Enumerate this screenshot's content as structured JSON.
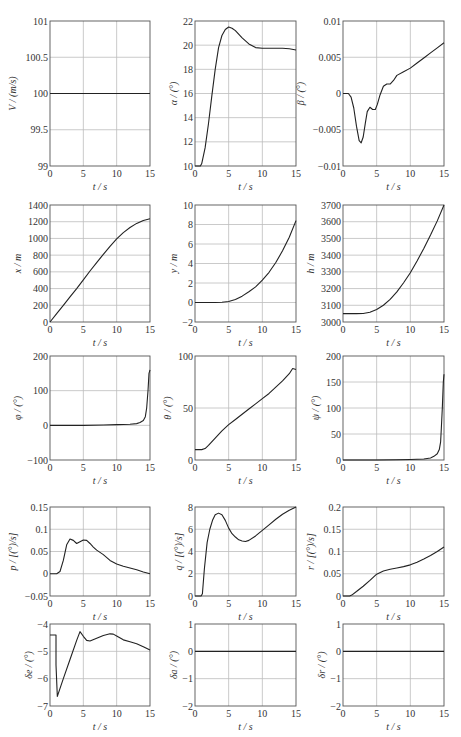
{
  "chart_data": [
    {
      "type": "line",
      "id": "V",
      "title": "",
      "xlabel": "t / s",
      "ylabel": "V / (m/s)",
      "xlim": [
        0,
        15
      ],
      "ylim": [
        99,
        101
      ],
      "xticks": [
        0,
        5,
        10,
        15
      ],
      "yticks": [
        99,
        99.5,
        100,
        100.5,
        101
      ],
      "yticklabels": [
        "99",
        "99.5",
        "100",
        "100.5",
        "101"
      ],
      "grid": true,
      "series": [
        {
          "name": "V",
          "x": [
            0,
            15
          ],
          "y": [
            100,
            100
          ]
        }
      ]
    },
    {
      "type": "line",
      "id": "alpha",
      "title": "",
      "xlabel": "t / s",
      "ylabel": "α / (°)",
      "xlim": [
        0,
        15
      ],
      "ylim": [
        10,
        22
      ],
      "xticks": [
        0,
        5,
        10,
        15
      ],
      "yticks": [
        10,
        12,
        14,
        16,
        18,
        20,
        22
      ],
      "yticklabels": [
        "10",
        "12",
        "14",
        "16",
        "18",
        "20",
        "22"
      ],
      "grid": true,
      "series": [
        {
          "name": "alpha",
          "x": [
            0,
            0.8,
            1.0,
            1.5,
            2,
            2.5,
            3,
            3.5,
            4,
            4.5,
            5,
            5.5,
            6,
            7,
            8,
            9,
            10,
            11,
            12,
            13,
            14,
            15
          ],
          "y": [
            10,
            10,
            10.2,
            11.5,
            13.5,
            15.8,
            18,
            19.8,
            20.8,
            21.3,
            21.5,
            21.4,
            21.2,
            20.6,
            20.1,
            19.8,
            19.75,
            19.75,
            19.75,
            19.75,
            19.7,
            19.6
          ]
        }
      ]
    },
    {
      "type": "line",
      "id": "beta",
      "title": "",
      "xlabel": "t / s",
      "ylabel": "β / (°)",
      "xlim": [
        0,
        15
      ],
      "ylim": [
        -0.01,
        0.01
      ],
      "xticks": [
        0,
        5,
        10,
        15
      ],
      "yticks": [
        -0.01,
        -0.005,
        0,
        0.005,
        0.01
      ],
      "yticklabels": [
        "−0.01",
        "−0.005",
        "0",
        "0.005",
        "0.01"
      ],
      "grid": true,
      "series": [
        {
          "name": "beta",
          "x": [
            0,
            0.8,
            1.2,
            1.6,
            2.0,
            2.4,
            2.7,
            3.0,
            3.3,
            3.6,
            4.0,
            4.4,
            4.8,
            5.1,
            5.5,
            6.0,
            6.5,
            7.0,
            7.5,
            8,
            9,
            10,
            11,
            12,
            13,
            14,
            15
          ],
          "y": [
            0,
            0,
            -0.0005,
            -0.002,
            -0.0045,
            -0.0065,
            -0.0068,
            -0.006,
            -0.0042,
            -0.0025,
            -0.0019,
            -0.0022,
            -0.0022,
            -0.0015,
            -0.0002,
            0.001,
            0.0013,
            0.0013,
            0.0018,
            0.0025,
            0.003,
            0.0035,
            0.0042,
            0.0049,
            0.0056,
            0.0063,
            0.007
          ]
        }
      ]
    },
    {
      "type": "line",
      "id": "x",
      "title": "",
      "xlabel": "t / s",
      "ylabel": "x / m",
      "xlim": [
        0,
        15
      ],
      "ylim": [
        0,
        1400
      ],
      "xticks": [
        0,
        5,
        10,
        15
      ],
      "yticks": [
        0,
        200,
        400,
        600,
        800,
        1000,
        1200,
        1400
      ],
      "yticklabels": [
        "0",
        "200",
        "400",
        "600",
        "800",
        "1000",
        "1200",
        "1400"
      ],
      "grid": true,
      "series": [
        {
          "name": "x",
          "x": [
            0,
            1,
            2,
            3,
            4,
            5,
            6,
            7,
            8,
            9,
            10,
            11,
            12,
            13,
            14,
            15
          ],
          "y": [
            0,
            100,
            200,
            300,
            400,
            505,
            610,
            710,
            810,
            905,
            995,
            1070,
            1130,
            1180,
            1215,
            1235
          ]
        }
      ]
    },
    {
      "type": "line",
      "id": "y",
      "title": "",
      "xlabel": "t / s",
      "ylabel": "y / m",
      "xlim": [
        0,
        15
      ],
      "ylim": [
        -2,
        10
      ],
      "xticks": [
        0,
        5,
        10,
        15
      ],
      "yticks": [
        -2,
        0,
        2,
        4,
        6,
        8,
        10
      ],
      "yticklabels": [
        "−2",
        "0",
        "2",
        "4",
        "6",
        "8",
        "10"
      ],
      "grid": true,
      "series": [
        {
          "name": "y",
          "x": [
            0,
            3,
            4,
            5,
            6,
            7,
            8,
            9,
            10,
            11,
            12,
            13,
            14,
            15
          ],
          "y": [
            0,
            0,
            0.02,
            0.1,
            0.3,
            0.65,
            1.1,
            1.6,
            2.3,
            3.1,
            4.1,
            5.3,
            6.7,
            8.4
          ]
        }
      ]
    },
    {
      "type": "line",
      "id": "h",
      "title": "",
      "xlabel": "t / s",
      "ylabel": "h / m",
      "xlim": [
        0,
        15
      ],
      "ylim": [
        3000,
        3700
      ],
      "xticks": [
        0,
        5,
        10,
        15
      ],
      "yticks": [
        3000,
        3100,
        3200,
        3300,
        3400,
        3500,
        3600,
        3700
      ],
      "yticklabels": [
        "3000",
        "3100",
        "3200",
        "3300",
        "3400",
        "3500",
        "3600",
        "3700"
      ],
      "grid": true,
      "series": [
        {
          "name": "h",
          "x": [
            0,
            1,
            2,
            3,
            4,
            5,
            6,
            7,
            8,
            9,
            10,
            11,
            12,
            13,
            14,
            15
          ],
          "y": [
            3050,
            3050,
            3050,
            3051,
            3058,
            3075,
            3100,
            3135,
            3180,
            3235,
            3295,
            3365,
            3440,
            3520,
            3605,
            3700
          ]
        }
      ]
    },
    {
      "type": "line",
      "id": "phi",
      "title": "",
      "xlabel": "t / s",
      "ylabel": "φ / (°)",
      "xlim": [
        0,
        15
      ],
      "ylim": [
        -100,
        200
      ],
      "xticks": [
        0,
        5,
        10,
        15
      ],
      "yticks": [
        -100,
        0,
        100,
        200
      ],
      "yticklabels": [
        "−100",
        "0",
        "100",
        "200"
      ],
      "grid": true,
      "series": [
        {
          "name": "phi",
          "x": [
            0,
            5,
            8,
            10,
            12,
            13,
            13.5,
            14,
            14.3,
            14.5,
            14.7,
            14.85,
            15
          ],
          "y": [
            0,
            0,
            1,
            2,
            3,
            5,
            8,
            14,
            25,
            50,
            100,
            150,
            160
          ]
        }
      ]
    },
    {
      "type": "line",
      "id": "theta",
      "title": "",
      "xlabel": "t / s",
      "ylabel": "θ / (°)",
      "xlim": [
        0,
        15
      ],
      "ylim": [
        0,
        100
      ],
      "xticks": [
        0,
        5,
        10,
        15
      ],
      "yticks": [
        0,
        50,
        100
      ],
      "yticklabels": [
        "0",
        "50",
        "100"
      ],
      "grid": true,
      "series": [
        {
          "name": "theta",
          "x": [
            0,
            1,
            1.5,
            2,
            3,
            4,
            5,
            6,
            7,
            8,
            9,
            10,
            11,
            12,
            13,
            14,
            14.5,
            15
          ],
          "y": [
            10,
            10,
            11,
            14,
            21,
            28,
            34,
            39,
            44,
            49,
            54,
            59,
            64,
            70,
            76,
            83,
            88,
            87
          ]
        }
      ]
    },
    {
      "type": "line",
      "id": "psi",
      "title": "",
      "xlabel": "t / s",
      "ylabel": "ψ / (°)",
      "xlim": [
        0,
        15
      ],
      "ylim": [
        0,
        200
      ],
      "xticks": [
        0,
        5,
        10,
        15
      ],
      "yticks": [
        0,
        50,
        100,
        150,
        200
      ],
      "yticklabels": [
        "0",
        "50",
        "100",
        "150",
        "200"
      ],
      "grid": true,
      "series": [
        {
          "name": "psi",
          "x": [
            0,
            5,
            8,
            10,
            12,
            13,
            13.5,
            14,
            14.3,
            14.5,
            14.6,
            14.75,
            14.9,
            15
          ],
          "y": [
            0,
            0,
            0.5,
            1,
            2,
            4,
            7,
            12,
            20,
            35,
            60,
            100,
            150,
            165
          ]
        }
      ]
    },
    {
      "type": "line",
      "id": "p",
      "title": "",
      "xlabel": "t / s",
      "ylabel": "p / [(°)/s]",
      "xlim": [
        0,
        15
      ],
      "ylim": [
        -0.05,
        0.15
      ],
      "xticks": [
        0,
        5,
        10,
        15
      ],
      "yticks": [
        -0.05,
        0,
        0.05,
        0.1,
        0.15
      ],
      "yticklabels": [
        "−0.05",
        "0",
        "0.05",
        "0.1",
        "0.15"
      ],
      "grid": true,
      "series": [
        {
          "name": "p",
          "x": [
            0,
            1,
            1.5,
            2,
            2.5,
            3,
            3.5,
            4,
            4.5,
            5,
            5.5,
            6,
            6.5,
            7,
            8,
            9,
            10,
            11,
            12,
            13,
            14,
            15
          ],
          "y": [
            0,
            0,
            0.005,
            0.03,
            0.065,
            0.078,
            0.075,
            0.068,
            0.072,
            0.076,
            0.075,
            0.068,
            0.06,
            0.053,
            0.043,
            0.03,
            0.022,
            0.017,
            0.013,
            0.009,
            0.004,
            0
          ]
        }
      ]
    },
    {
      "type": "line",
      "id": "q",
      "title": "",
      "xlabel": "t / s",
      "ylabel": "q / [(°)/s]",
      "xlim": [
        0,
        15
      ],
      "ylim": [
        0,
        8
      ],
      "xticks": [
        0,
        5,
        10,
        15
      ],
      "yticks": [
        0,
        2,
        4,
        6,
        8
      ],
      "yticklabels": [
        "0",
        "2",
        "4",
        "6",
        "8"
      ],
      "grid": true,
      "series": [
        {
          "name": "q",
          "x": [
            0,
            0.9,
            1.1,
            1.4,
            1.8,
            2.2,
            2.6,
            3,
            3.5,
            4,
            4.5,
            5,
            5.5,
            6,
            6.5,
            7,
            7.5,
            8,
            9,
            10,
            11,
            12,
            13,
            14,
            15
          ],
          "y": [
            0,
            0,
            0.2,
            2.5,
            4.8,
            6,
            6.8,
            7.3,
            7.45,
            7.3,
            6.8,
            6.1,
            5.6,
            5.3,
            5.05,
            4.95,
            4.9,
            5.0,
            5.4,
            5.9,
            6.4,
            6.9,
            7.35,
            7.7,
            8.0
          ]
        }
      ]
    },
    {
      "type": "line",
      "id": "r",
      "title": "",
      "xlabel": "t / s",
      "ylabel": "r / [(°)/s]",
      "xlim": [
        0,
        15
      ],
      "ylim": [
        0,
        0.2
      ],
      "xticks": [
        0,
        5,
        10,
        15
      ],
      "yticks": [
        0,
        0.05,
        0.1,
        0.15,
        0.2
      ],
      "yticklabels": [
        "0",
        "0.05",
        "0.1",
        "0.15",
        "0.2"
      ],
      "grid": true,
      "series": [
        {
          "name": "r",
          "x": [
            0,
            1,
            1.3,
            2,
            3,
            4,
            5,
            6,
            7,
            8,
            9,
            10,
            11,
            12,
            13,
            14,
            15
          ],
          "y": [
            0,
            0,
            0.002,
            0.01,
            0.022,
            0.035,
            0.049,
            0.056,
            0.06,
            0.063,
            0.066,
            0.07,
            0.076,
            0.083,
            0.091,
            0.1,
            0.11
          ]
        }
      ]
    },
    {
      "type": "line",
      "id": "delta_e",
      "title": "",
      "xlabel": "t / s",
      "ylabel": "δe / (°)",
      "xlim": [
        0,
        15
      ],
      "ylim": [
        -7,
        -4
      ],
      "xticks": [
        0,
        5,
        10,
        15
      ],
      "yticks": [
        -7,
        -6,
        -5,
        -4
      ],
      "yticklabels": [
        "−7",
        "−6",
        "−5",
        "−4"
      ],
      "grid": true,
      "series": [
        {
          "name": "delta_e",
          "x": [
            0,
            0.9,
            0.9,
            1.1,
            2,
            3,
            4,
            4.5,
            5,
            5.5,
            6,
            7,
            8,
            9,
            9.5,
            10,
            11,
            12,
            13,
            14,
            15
          ],
          "y": [
            -4.4,
            -4.4,
            -5.5,
            -6.65,
            -6.0,
            -5.3,
            -4.6,
            -4.28,
            -4.45,
            -4.6,
            -4.62,
            -4.52,
            -4.42,
            -4.36,
            -4.37,
            -4.44,
            -4.58,
            -4.65,
            -4.72,
            -4.83,
            -4.95
          ]
        }
      ]
    },
    {
      "type": "line",
      "id": "delta_a",
      "title": "",
      "xlabel": "t / s",
      "ylabel": "δa / (°)",
      "xlim": [
        0,
        15
      ],
      "ylim": [
        -2,
        1
      ],
      "xticks": [
        0,
        5,
        10,
        15
      ],
      "yticks": [
        -2,
        -1,
        0,
        1
      ],
      "yticklabels": [
        "−2",
        "−1",
        "0",
        "1"
      ],
      "grid": true,
      "series": [
        {
          "name": "delta_a",
          "x": [
            0,
            15
          ],
          "y": [
            0,
            0
          ]
        }
      ]
    },
    {
      "type": "line",
      "id": "delta_r",
      "title": "",
      "xlabel": "t / s",
      "ylabel": "δr / (°)",
      "xlim": [
        0,
        15
      ],
      "ylim": [
        -2,
        1
      ],
      "xticks": [
        0,
        5,
        10,
        15
      ],
      "yticks": [
        -2,
        -1,
        0,
        1
      ],
      "yticklabels": [
        "−2",
        "−1",
        "0",
        "1"
      ],
      "grid": true,
      "series": [
        {
          "name": "delta_r",
          "x": [
            0,
            15
          ],
          "y": [
            0,
            0
          ]
        }
      ]
    }
  ]
}
